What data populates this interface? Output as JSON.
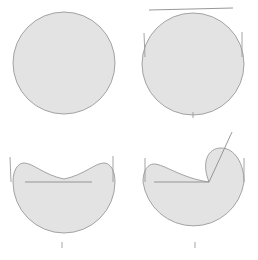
{
  "figure": {
    "layout": {
      "rows": 2,
      "columns": 2,
      "panel_width": 129,
      "panel_height": 130,
      "canvas_width": 258,
      "canvas_height": 260
    },
    "colors": {
      "region_fill": "#e3e3e3",
      "region_stroke": "#9a9a9a",
      "chord_stroke": "#8c8c8c",
      "tick_stroke": "#9a9a9a",
      "background": "#ffffff"
    },
    "panels": [
      {
        "id": "panel-top-left",
        "name": "undeformed-disk",
        "label": "",
        "shape_type": "disk",
        "center": [
          64,
          63
        ],
        "radius": 51,
        "chords": [],
        "ticks": [],
        "rays": []
      },
      {
        "id": "panel-top-right",
        "name": "disk-with-tangent-chord",
        "label": "",
        "shape_type": "disk",
        "center": [
          64,
          64
        ],
        "radius": 51,
        "chords": [
          {
            "name": "top-tangent-chord",
            "x1": 20,
            "y1": 10,
            "x2": 104,
            "y2": 8
          }
        ],
        "ticks": [
          {
            "name": "left-side-tick",
            "x1": 15,
            "y1": 33,
            "x2": 16,
            "y2": 57
          },
          {
            "name": "right-side-tick",
            "x1": 113,
            "y1": 32,
            "x2": 113,
            "y2": 57
          },
          {
            "name": "bottom-center-tick",
            "x1": 64,
            "y1": 112,
            "x2": 64,
            "y2": 118
          }
        ],
        "rays": []
      },
      {
        "id": "panel-bottom-left",
        "name": "concave-top-region",
        "label": "",
        "shape_type": "concave-lune",
        "center": [
          64,
          62
        ],
        "radius": 51,
        "chords": [
          {
            "name": "interior-horizontal-chord",
            "x1": 25,
            "y1": 52,
            "x2": 92,
            "y2": 52
          }
        ],
        "ticks": [
          {
            "name": "left-side-tick",
            "x1": 10,
            "y1": 27,
            "x2": 11,
            "y2": 52
          },
          {
            "name": "right-side-tick",
            "x1": 113,
            "y1": 26,
            "x2": 113,
            "y2": 52
          },
          {
            "name": "bottom-center-tick",
            "x1": 62,
            "y1": 112,
            "x2": 62,
            "y2": 118
          }
        ],
        "rays": []
      },
      {
        "id": "panel-bottom-right",
        "name": "cusped-region-with-ray",
        "label": "",
        "shape_type": "cusped-lune",
        "center": [
          64,
          62
        ],
        "radius": 51,
        "chords": [
          {
            "name": "interior-horizontal-chord",
            "x1": 25,
            "y1": 52,
            "x2": 80,
            "y2": 52
          }
        ],
        "ticks": [
          {
            "name": "left-side-tick",
            "x1": 16,
            "y1": 28,
            "x2": 16,
            "y2": 52
          },
          {
            "name": "right-side-tick",
            "x1": 115,
            "y1": 28,
            "x2": 115,
            "y2": 52
          },
          {
            "name": "bottom-center-tick",
            "x1": 66,
            "y1": 112,
            "x2": 66,
            "y2": 118
          }
        ],
        "rays": [
          {
            "name": "cusp-ray",
            "x1": 80,
            "y1": 52,
            "x2": 103,
            "y2": 2
          }
        ]
      }
    ]
  }
}
